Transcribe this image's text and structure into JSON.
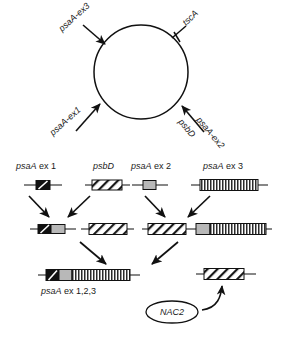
{
  "figure": {
    "colors": {
      "ink": "#1a1a1a",
      "line": "#000000",
      "solid_black": "#111111",
      "gray_fill": "#b8b8b8",
      "white_fill": "#ffffff",
      "stripe_dark": "#2b2b2b"
    }
  },
  "genome_map": {
    "name": "chloroplast-circular-genome",
    "shape": "circle",
    "loci": [
      {
        "id": "psaA-ex3",
        "label": "psaA-ex3",
        "position": "upper-left",
        "arrow": "inward-down-right"
      },
      {
        "id": "tscA",
        "label": "tscA",
        "position": "upper-right",
        "arrow": "tick-mark"
      },
      {
        "id": "psaA-ex1",
        "label": "psaA-ex1",
        "position": "lower-left",
        "arrow": "inward-up-right"
      },
      {
        "id": "psaA-ex2",
        "label": "psaA-ex2",
        "position": "lower-right",
        "arrow": "inward-up-left"
      },
      {
        "id": "psbD",
        "label": "psbD",
        "position": "lower-right-below",
        "arrow": "none"
      }
    ]
  },
  "transcripts_row1": {
    "name": "primary-transcripts",
    "items": [
      {
        "id": "psaA-ex-1",
        "label": "psaA ex 1",
        "label_italic": "psaA",
        "label_rest": " ex 1",
        "fill": "solid-black-slash"
      },
      {
        "id": "psbD",
        "label": "psbD",
        "label_italic": "psbD",
        "label_rest": "",
        "fill": "diagonal-hatch"
      },
      {
        "id": "psaA-ex-2",
        "label": "psaA ex 2",
        "label_italic": "psaA",
        "label_rest": " ex 2",
        "fill": "gray"
      },
      {
        "id": "psaA-ex-3",
        "label": "psaA ex 3",
        "label_italic": "psaA",
        "label_rest": " ex 3",
        "fill": "vertical-stripes"
      }
    ]
  },
  "transcripts_row2": {
    "name": "intermediate-transcripts",
    "items": [
      {
        "id": "intermediate-1",
        "segments": [
          "solid-black-slash",
          "gray"
        ]
      },
      {
        "id": "intermediate-2",
        "segments": [
          "diagonal-hatch"
        ]
      },
      {
        "id": "intermediate-3",
        "segments": [
          "diagonal-hatch",
          "gray",
          "vertical-stripes"
        ]
      }
    ]
  },
  "transcripts_row3": {
    "name": "mature-and-released",
    "mature": {
      "id": "psaA-ex-123",
      "label": "psaA ex 1,2,3",
      "label_italic": "psaA",
      "label_rest": " ex 1,2,3",
      "segments": [
        "solid-black-slash",
        "gray",
        "vertical-stripes"
      ]
    },
    "released": {
      "id": "psbD-released",
      "segments": [
        "diagonal-hatch"
      ]
    }
  },
  "factor": {
    "name": "nac2-factor",
    "label": "NAC2",
    "shape": "ellipse",
    "arrow": "curved-up-right"
  }
}
